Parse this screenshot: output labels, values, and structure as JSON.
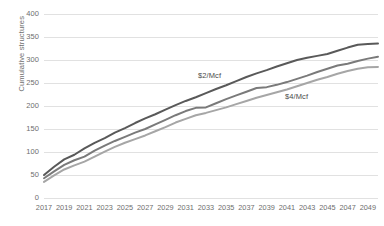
{
  "chart_data": {
    "type": "line",
    "title": "",
    "xlabel": "",
    "ylabel": "Cumulative structures",
    "xlim": [
      2017,
      2050
    ],
    "ylim": [
      0,
      400
    ],
    "grid": true,
    "gridlines": "horizontal",
    "legend_position": "inline-annotations",
    "ytick_labels": [
      "400",
      "350",
      "300",
      "250",
      "200",
      "150",
      "100",
      "50",
      "0"
    ],
    "ytick_values": [
      400,
      350,
      300,
      250,
      200,
      150,
      100,
      50,
      0
    ],
    "xtick_labels": [
      "2017",
      "2019",
      "2021",
      "2023",
      "2025",
      "2027",
      "2029",
      "2031",
      "2033",
      "2035",
      "2037",
      "2039",
      "2041",
      "2043",
      "2045",
      "2047",
      "2049"
    ],
    "xtick_values": [
      2017,
      2019,
      2021,
      2023,
      2025,
      2027,
      2029,
      2031,
      2033,
      2035,
      2037,
      2039,
      2041,
      2043,
      2045,
      2047,
      2049
    ],
    "x": [
      2017,
      2018,
      2019,
      2020,
      2021,
      2022,
      2023,
      2024,
      2025,
      2026,
      2027,
      2028,
      2029,
      2030,
      2031,
      2032,
      2033,
      2034,
      2035,
      2036,
      2037,
      2038,
      2039,
      2040,
      2041,
      2042,
      2043,
      2044,
      2045,
      2046,
      2047,
      2048,
      2049,
      2050
    ],
    "series": [
      {
        "name": "$2/Mcf",
        "color": "#595959",
        "annotation": "$2/Mcf",
        "values": [
          50,
          68,
          84,
          94,
          108,
          120,
          130,
          142,
          152,
          163,
          173,
          182,
          192,
          202,
          211,
          219,
          228,
          237,
          245,
          254,
          263,
          271,
          278,
          286,
          293,
          300,
          305,
          309,
          313,
          320,
          327,
          333,
          335,
          336
        ]
      },
      {
        "name": "mid",
        "color": "#7a7a7a",
        "annotation": "",
        "values": [
          43,
          58,
          72,
          82,
          90,
          103,
          114,
          124,
          133,
          142,
          150,
          160,
          170,
          180,
          189,
          196,
          197,
          206,
          215,
          223,
          231,
          239,
          241,
          246,
          252,
          259,
          266,
          274,
          281,
          288,
          292,
          298,
          303,
          307
        ]
      },
      {
        "name": "$4/Mcf",
        "color": "#a6a6a6",
        "annotation": "$4/Mcf",
        "values": [
          35,
          49,
          62,
          71,
          79,
          90,
          101,
          111,
          120,
          128,
          136,
          145,
          154,
          164,
          172,
          180,
          185,
          191,
          197,
          204,
          211,
          218,
          224,
          230,
          236,
          243,
          250,
          257,
          263,
          270,
          276,
          281,
          284,
          285
        ]
      }
    ],
    "annotations": [
      {
        "text": "$2/Mcf",
        "x_px": 198,
        "y_px": 72
      },
      {
        "text": "$4/Mcf",
        "x_px": 285,
        "y_px": 93
      }
    ]
  },
  "style": {
    "grid_color": "#d9d9d9",
    "tick_text_color": "#6e6e6e",
    "background": "#ffffff"
  }
}
